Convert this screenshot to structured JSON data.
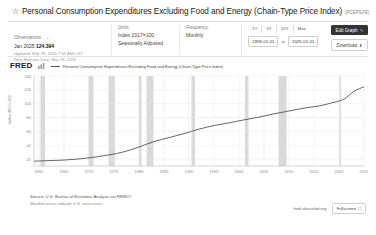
{
  "header": {
    "star_icon": "☆",
    "title": "Personal Consumption Expenditures Excluding Food and Energy (Chain-Type Price Index)",
    "series_id": "(PCEPILFE)"
  },
  "meta": {
    "observations_label": "Observations",
    "observations_caret": "⌄",
    "latest_period": "Jan 2025",
    "latest_value": "124.394",
    "updated": "Updated: Feb 28, 2025 7:45 AM CST",
    "next_release": "Next Release Date: Mar 28, 2025",
    "units_label": "Units:",
    "units_value": "Index 2017=100,",
    "units_value2": "Seasonally Adjusted",
    "frequency_label": "Frequency:",
    "frequency_value": "Monthly"
  },
  "controls": {
    "ranges": [
      "1Y",
      "5Y",
      "10Y",
      "Max"
    ],
    "date_from": "1959-01-01",
    "date_to_label": "to",
    "date_to": "2025-01-01",
    "edit_graph": "Edit Graph",
    "edit_icon": "✎",
    "download": "Download",
    "download_icon": "⬇"
  },
  "chart_data": {
    "type": "line",
    "title": "Personal Consumption Expenditures Excluding Food and Energy (Chain-Type Price Index)",
    "legend_label": "Personal Consumption Expenditures Excluding Food and Energy (Chain-Type Price Index)",
    "legend_position": "top",
    "xlabel": "",
    "ylabel": "Index 2017=100",
    "ylim": [
      10,
      140
    ],
    "yticks": [
      140,
      120,
      100,
      80,
      60,
      40,
      20
    ],
    "xlim": [
      1959,
      2025
    ],
    "xticks": [
      "1960",
      "1965",
      "1970",
      "1975",
      "1980",
      "1985",
      "1990",
      "1995",
      "2000",
      "2005",
      "2010",
      "2015",
      "2020",
      "2025"
    ],
    "grid": true,
    "line_color": "#555555",
    "recession_color": "#d9d9d9",
    "recessions": [
      [
        1960.3,
        1961.2
      ],
      [
        1969.9,
        1970.9
      ],
      [
        1973.9,
        1975.2
      ],
      [
        1980.0,
        1980.5
      ],
      [
        1981.5,
        1982.9
      ],
      [
        1990.5,
        1991.2
      ],
      [
        2001.2,
        2001.9
      ],
      [
        2007.9,
        2009.5
      ],
      [
        2020.1,
        2020.4
      ]
    ],
    "x": [
      1959,
      1962,
      1965,
      1968,
      1971,
      1974,
      1977,
      1980,
      1983,
      1986,
      1989,
      1992,
      1995,
      1998,
      2001,
      2004,
      2007,
      2010,
      2013,
      2016,
      2019,
      2021,
      2023,
      2025
    ],
    "values": [
      17.0,
      17.8,
      18.6,
      20.2,
      22.6,
      26.0,
      30.5,
      37.4,
      45.3,
      51.0,
      56.8,
      63.2,
      68.4,
      72.3,
      76.6,
      80.6,
      85.4,
      89.5,
      93.6,
      96.8,
      102.0,
      106.5,
      118.0,
      124.4
    ]
  },
  "footer": {
    "source": "Source: U.S. Bureau of Economic Analysis via FRED®",
    "note": "Shaded areas indicate U.S. recessions.",
    "url": "fred.stlouisfed.org",
    "fullscreen": "Fullscreen",
    "fullscreen_icon": "⛶"
  },
  "branding": {
    "fred": "FRED",
    "fred_sub": "—"
  }
}
